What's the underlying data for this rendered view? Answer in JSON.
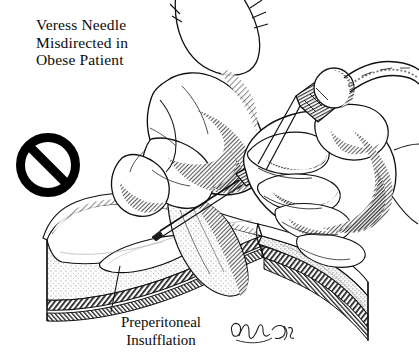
{
  "figure": {
    "kind": "medical-line-illustration",
    "subject": "Laparoscopic Veress needle insertion error in an obese patient",
    "background_color": "#ffffff",
    "ink_color": "#111111",
    "width": 419,
    "height": 362
  },
  "title": {
    "lines": [
      "Veress Needle",
      "Misdirected in",
      "Obese Patient"
    ],
    "line1": "Veress Needle",
    "line2": "Misdirected in",
    "line3": "Obese Patient"
  },
  "caption": {
    "lines": [
      "Preperitoneal",
      "Insufflation"
    ],
    "line1": "Preperitoneal",
    "line2": "Insufflation"
  },
  "prohibition_symbol": {
    "icon": "no-entry-icon",
    "meaning": "incorrect technique",
    "center_x": 48,
    "center_y": 165,
    "outer_radius": 28,
    "color": "#000000"
  },
  "signature": {
    "text": "'93",
    "style": "handwritten-cursive-artist-signature"
  },
  "labels": {
    "left_hand": "surgeon-left-hand-lifting-abdominal-wall",
    "right_hand": "surgeon-right-hand-holding-needle",
    "needle": "veress-needle",
    "needle_hub": "veress-needle-hub-and-valve",
    "tubing": "insufflation-tubing",
    "cross_section": "abdominal-wall-cross-section",
    "fat_layer": "subcutaneous-fat-layer",
    "fascia_layer": "fascia-and-peritoneum-layers",
    "gas_pocket": "preperitoneal-gas-pocket",
    "leader_line": "caption-leader-line"
  }
}
